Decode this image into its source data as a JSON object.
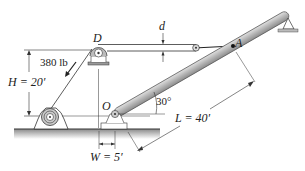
{
  "diagram": {
    "labels": {
      "pulley": "D",
      "pivot": "O",
      "attach_point": "A",
      "gap": "d",
      "force": "380 lb",
      "height": "H = 20′",
      "length": "L = 40′",
      "offset": "W = 5′",
      "angle": "30°"
    },
    "colors": {
      "line": "#333333",
      "boom_fill": "#b8b8b8",
      "boom_edge": "#555555",
      "ground": "#9a9a9a"
    }
  }
}
